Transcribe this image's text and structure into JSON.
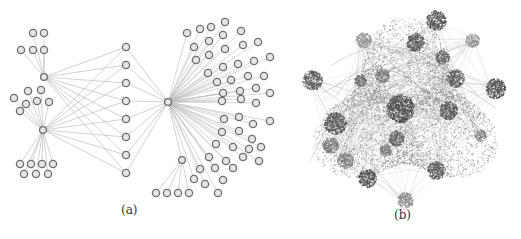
{
  "figure": {
    "panel_a": {
      "label": "(a)",
      "edge_color": "#b4b4b4",
      "node_stroke": "#6e6e6e",
      "node_fill": "#e6e6e6",
      "node_radius": 3.6,
      "hubs": {
        "top": [
          44,
          77
        ],
        "mid": [
          43,
          130
        ],
        "center": [
          168,
          102
        ],
        "sub": [
          182,
          160
        ]
      },
      "column": [
        [
          126,
          47
        ],
        [
          126,
          65
        ],
        [
          126,
          83
        ],
        [
          126,
          101
        ],
        [
          126,
          119
        ],
        [
          126,
          137
        ],
        [
          126,
          155
        ],
        [
          126,
          173
        ]
      ],
      "top_children": [
        [
          33,
          33
        ],
        [
          44,
          33
        ],
        [
          21,
          50
        ],
        [
          33,
          50
        ],
        [
          44,
          50
        ]
      ],
      "top_chain": [
        [
          [
            33,
            33
          ],
          [
            33,
            50
          ]
        ],
        [
          [
            44,
            33
          ],
          [
            44,
            50
          ]
        ]
      ],
      "mid_children": [
        [
          28,
          91
        ],
        [
          41,
          90
        ],
        [
          14,
          98
        ],
        [
          26,
          104
        ],
        [
          37,
          101
        ],
        [
          49,
          102
        ],
        [
          20,
          111
        ],
        [
          20,
          164
        ],
        [
          31,
          164
        ],
        [
          42,
          164
        ],
        [
          53,
          164
        ],
        [
          24,
          174
        ],
        [
          36,
          174
        ],
        [
          48,
          174
        ]
      ],
      "sub_children": [
        [
          156,
          193
        ],
        [
          167,
          193
        ],
        [
          178,
          193
        ],
        [
          189,
          193
        ]
      ],
      "fan": [
        [
          187,
          33
        ],
        [
          200,
          29
        ],
        [
          211,
          27
        ],
        [
          225,
          22
        ],
        [
          194,
          47
        ],
        [
          209,
          41
        ],
        [
          223,
          35
        ],
        [
          241,
          31
        ],
        [
          196,
          60
        ],
        [
          209,
          55
        ],
        [
          225,
          49
        ],
        [
          243,
          45
        ],
        [
          258,
          42
        ],
        [
          208,
          73
        ],
        [
          223,
          67
        ],
        [
          238,
          64
        ],
        [
          254,
          61
        ],
        [
          270,
          57
        ],
        [
          217,
          82
        ],
        [
          231,
          80
        ],
        [
          248,
          76
        ],
        [
          264,
          76
        ],
        [
          223,
          93
        ],
        [
          240,
          91
        ],
        [
          256,
          88
        ],
        [
          270,
          93
        ],
        [
          222,
          101
        ],
        [
          241,
          99
        ],
        [
          256,
          103
        ],
        [
          224,
          119
        ],
        [
          239,
          117
        ],
        [
          253,
          124
        ],
        [
          270,
          121
        ],
        [
          222,
          132
        ],
        [
          239,
          131
        ],
        [
          252,
          139
        ],
        [
          216,
          144
        ],
        [
          233,
          147
        ],
        [
          249,
          149
        ],
        [
          261,
          147
        ],
        [
          209,
          157
        ],
        [
          226,
          161
        ],
        [
          243,
          157
        ],
        [
          259,
          161
        ],
        [
          200,
          169
        ],
        [
          215,
          168
        ],
        [
          233,
          168
        ],
        [
          194,
          179
        ],
        [
          205,
          184
        ],
        [
          223,
          180
        ],
        [
          218,
          193
        ]
      ]
    },
    "panel_b": {
      "label": "(b)",
      "center": [
        405,
        112
      ],
      "body_radius": 88,
      "base_color": "#8c8c8c",
      "clusters": [
        {
          "x": 436,
          "y": 20,
          "r": 10,
          "shade": 0.85
        },
        {
          "x": 312,
          "y": 80,
          "r": 10,
          "shade": 0.8
        },
        {
          "x": 495,
          "y": 88,
          "r": 10,
          "shade": 0.9
        },
        {
          "x": 400,
          "y": 108,
          "r": 14,
          "shade": 0.9
        },
        {
          "x": 415,
          "y": 42,
          "r": 9,
          "shade": 0.85
        },
        {
          "x": 442,
          "y": 57,
          "r": 7,
          "shade": 0.75
        },
        {
          "x": 455,
          "y": 78,
          "r": 9,
          "shade": 0.8
        },
        {
          "x": 448,
          "y": 110,
          "r": 9,
          "shade": 0.85
        },
        {
          "x": 335,
          "y": 123,
          "r": 11,
          "shade": 0.85
        },
        {
          "x": 330,
          "y": 145,
          "r": 8,
          "shade": 0.6
        },
        {
          "x": 345,
          "y": 160,
          "r": 8,
          "shade": 0.55
        },
        {
          "x": 367,
          "y": 178,
          "r": 9,
          "shade": 0.9
        },
        {
          "x": 436,
          "y": 170,
          "r": 9,
          "shade": 0.8
        },
        {
          "x": 405,
          "y": 200,
          "r": 8,
          "shade": 0.45
        },
        {
          "x": 396,
          "y": 138,
          "r": 8,
          "shade": 0.75
        },
        {
          "x": 382,
          "y": 75,
          "r": 7,
          "shade": 0.6
        },
        {
          "x": 360,
          "y": 80,
          "r": 6,
          "shade": 0.7
        },
        {
          "x": 363,
          "y": 40,
          "r": 8,
          "shade": 0.4
        },
        {
          "x": 472,
          "y": 40,
          "r": 7,
          "shade": 0.4
        },
        {
          "x": 480,
          "y": 135,
          "r": 6,
          "shade": 0.5
        },
        {
          "x": 385,
          "y": 150,
          "r": 6,
          "shade": 0.6
        }
      ]
    }
  }
}
